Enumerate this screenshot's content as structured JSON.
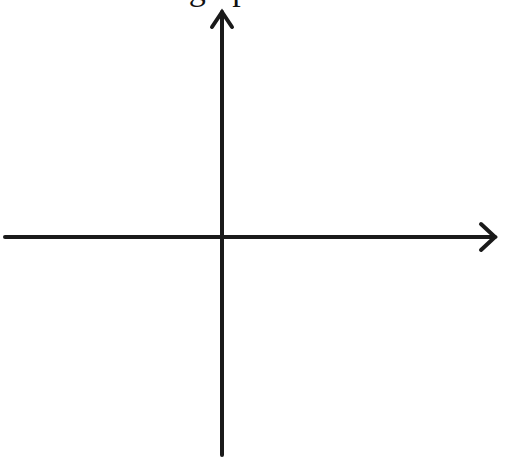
{
  "diagram": {
    "title": "graph",
    "type": "coordinate-axes",
    "stroke_color": "#1a1a1a",
    "background": "#ffffff",
    "axes": {
      "x_axis": {
        "direction": "right",
        "arrow": "right-end"
      },
      "y_axis": {
        "direction": "up",
        "arrow": "top-end"
      },
      "origin_px": [
        222,
        237
      ]
    }
  }
}
